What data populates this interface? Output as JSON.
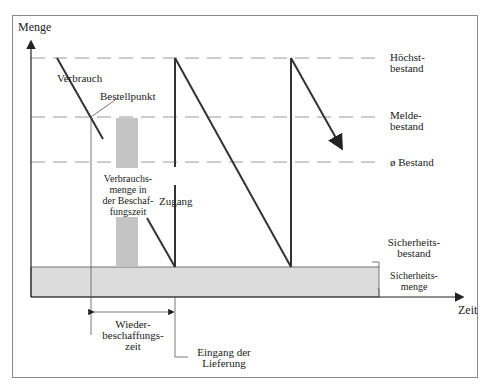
{
  "diagram": {
    "type": "inventory-sawtooth",
    "axes": {
      "y_label": "Menge",
      "x_label": "Zeit"
    },
    "levels": [
      {
        "id": "max",
        "label_line1": "Höchst-",
        "label_line2": "bestand"
      },
      {
        "id": "reorder",
        "label_line1": "Melde-",
        "label_line2": "bestand"
      },
      {
        "id": "avg",
        "label_line1": "ø Bestand"
      },
      {
        "id": "safety",
        "label_line1": "Sicherheits-",
        "label_line2": "bestand"
      }
    ],
    "annotations": {
      "consumption": "Verbrauch",
      "reorder_point": "Bestellpunkt",
      "consumption_during_lead": [
        "Verbrauchs-",
        "menge in",
        "der Beschaf-",
        "fungszeit"
      ],
      "receipt": "Zugang",
      "safety_quantity": [
        "Sicherheits-",
        "menge"
      ],
      "lead_time": [
        "Wieder-",
        "beschaffungs-",
        "zeit"
      ],
      "delivery": [
        "Eingang der",
        "Lieferung"
      ]
    },
    "colors": {
      "line": "#333333",
      "dash": "#9a9a9a",
      "safety_fill": "#dcdcdc",
      "bar_fill": "#c4c4c4",
      "frame": "#8a8a8a"
    }
  }
}
